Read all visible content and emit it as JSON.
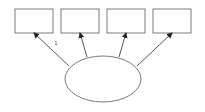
{
  "diagram": {
    "type": "path-diagram",
    "latent": {
      "id": "latent",
      "label": ""
    },
    "indicators": [
      {
        "id": "ind1",
        "label": ""
      },
      {
        "id": "ind2",
        "label": ""
      },
      {
        "id": "ind3",
        "label": ""
      },
      {
        "id": "ind4",
        "label": ""
      }
    ],
    "paths": [
      {
        "from": "latent",
        "to": "ind1",
        "label": "1"
      },
      {
        "from": "latent",
        "to": "ind2",
        "label": ""
      },
      {
        "from": "latent",
        "to": "ind3",
        "label": ""
      },
      {
        "from": "latent",
        "to": "ind4",
        "label": ""
      }
    ],
    "colors": {
      "stroke": "#7a7a7a",
      "arrow": "#444444",
      "background": "#ffffff"
    }
  }
}
